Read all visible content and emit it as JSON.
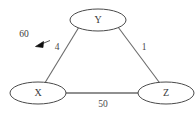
{
  "diagram": {
    "type": "weighted-undirected-graph",
    "nodes": [
      {
        "id": "Y",
        "label": "Y",
        "cx": 98,
        "cy": 20,
        "rx": 28,
        "ry": 11
      },
      {
        "id": "X",
        "label": "X",
        "cx": 38,
        "cy": 93,
        "rx": 28,
        "ry": 11
      },
      {
        "id": "Z",
        "label": "Z",
        "cx": 166,
        "cy": 93,
        "rx": 28,
        "ry": 11
      }
    ],
    "edges": [
      {
        "from": "X",
        "to": "Y",
        "weight": "4",
        "label_x": 57,
        "label_y": 48
      },
      {
        "from": "Y",
        "to": "Z",
        "weight": "1",
        "label_x": 144,
        "label_y": 48
      },
      {
        "from": "X",
        "to": "Z",
        "weight": "50",
        "label_x": 103,
        "label_y": 105
      }
    ],
    "annotations": [
      {
        "name": "weight-callout",
        "text": "60",
        "text_x": 24,
        "text_y": 35,
        "arrow_from_x": 50,
        "arrow_from_y": 40,
        "arrow_to_x": 36,
        "arrow_to_y": 46
      }
    ],
    "colors": {
      "background": "#ffffff",
      "node_stroke": "#4a4a4a",
      "node_fill": "#ffffff",
      "edge_stroke": "#6b6b6b",
      "text": "#3a3a3a",
      "arrow": "#101010"
    }
  }
}
